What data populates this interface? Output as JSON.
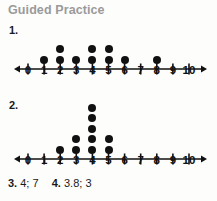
{
  "header": {
    "title": "Guided Practice"
  },
  "colors": {
    "background": "#fdfdfc",
    "title_gray": "#9a9a9a",
    "ink": "#111111"
  },
  "problems": [
    {
      "number_label": "1.",
      "chart_data": {
        "type": "dot-plot",
        "title": "",
        "xlabel": "",
        "ylabel": "",
        "xlim": [
          0,
          10
        ],
        "grid": false,
        "legend": "none",
        "categories": [
          "0",
          "1",
          "2",
          "3",
          "4",
          "5",
          "6",
          "7",
          "8",
          "9",
          "10"
        ],
        "values": [
          0,
          1,
          2,
          1,
          2,
          2,
          1,
          0,
          1,
          0,
          0
        ],
        "axis_ticks": [
          "0",
          "1",
          "2",
          "3",
          "4",
          "5",
          "6",
          "7",
          "8",
          "9",
          "10"
        ],
        "axis_arrows": "both"
      }
    },
    {
      "number_label": "2.",
      "chart_data": {
        "type": "dot-plot",
        "title": "",
        "xlabel": "",
        "ylabel": "",
        "xlim": [
          0,
          10
        ],
        "grid": false,
        "legend": "none",
        "categories": [
          "0",
          "1",
          "2",
          "3",
          "4",
          "5",
          "6",
          "7",
          "8",
          "9",
          "10"
        ],
        "values": [
          0,
          0,
          1,
          2,
          5,
          2,
          0,
          0,
          0,
          0,
          0
        ],
        "axis_ticks": [
          "0",
          "1",
          "2",
          "3",
          "4",
          "5",
          "6",
          "7",
          "8",
          "9",
          "10"
        ],
        "axis_arrows": "both"
      }
    }
  ],
  "answers": {
    "item3_label": "3.",
    "item3_value": "4; 7",
    "item4_label": "4.",
    "item4_value": "3.8; 3"
  }
}
